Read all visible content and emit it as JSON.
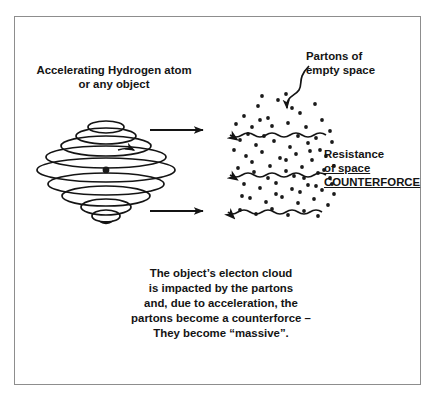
{
  "figure": {
    "type": "physics-concept-diagram",
    "background_color": "#ffffff",
    "border_color": "#8d8d8d",
    "ink_color": "#141414"
  },
  "labels": {
    "object_line1": "Accelerating Hydrogen atom",
    "object_line2": "or any object",
    "partons_line1": "Partons of",
    "partons_line2": "empty space",
    "resistance_line1": "Resistance",
    "resistance_line2": "of space",
    "resistance_line3": "COUNTERFORCE"
  },
  "caption": {
    "line1": "The object’s electon cloud",
    "line2": "is impacted by the partons",
    "line3": "and, due to acceleration, the",
    "line4": "partons become a counterforce –",
    "line5": "They become “massive”."
  },
  "diagram_data": {
    "object": {
      "name": "accelerating-hydrogen-atom",
      "shape": "stacked-concentric-ellipses",
      "center_x": 106,
      "center_y": 170,
      "ellipse_count": 9,
      "nucleus_dot": {
        "cx": 106,
        "cy": 170,
        "r": 3.4
      },
      "ellipses": [
        {
          "cy": 127,
          "rx": 18,
          "ry": 6
        },
        {
          "cy": 136,
          "rx": 30,
          "ry": 8
        },
        {
          "cy": 146,
          "rx": 45,
          "ry": 10
        },
        {
          "cy": 157,
          "rx": 60,
          "ry": 11
        },
        {
          "cy": 170,
          "rx": 69,
          "ry": 12
        },
        {
          "cy": 184,
          "rx": 58,
          "ry": 11
        },
        {
          "cy": 196,
          "rx": 44,
          "ry": 10
        },
        {
          "cy": 207,
          "rx": 25,
          "ry": 8
        },
        {
          "cy": 216,
          "rx": 14,
          "ry": 6
        }
      ]
    },
    "motion_arrows": [
      {
        "name": "motion-arrow-top",
        "direction": "right",
        "x1": 150,
        "y1": 130,
        "x2": 203,
        "y2": 130
      },
      {
        "name": "motion-arrow-bottom",
        "direction": "right",
        "x1": 150,
        "y1": 211,
        "x2": 203,
        "y2": 211
      }
    ],
    "counterforce_arrows": [
      {
        "name": "counterforce-wave-top",
        "direction": "left",
        "y": 135,
        "x_tip": 228,
        "x_tail": 326
      },
      {
        "name": "counterforce-wave-middle",
        "direction": "left",
        "y": 175,
        "x_tip": 228,
        "x_tail": 326
      },
      {
        "name": "counterforce-wave-bottom",
        "direction": "left",
        "y": 212,
        "x_tip": 228,
        "x_tail": 322
      }
    ],
    "pointer_arrow": {
      "name": "partons-pointer-arrow",
      "style": "curved-s-shape",
      "from_x": 309,
      "from_y": 66,
      "to_x": 287,
      "to_y": 113
    },
    "parton_dots": {
      "count": 74,
      "radius": 1.9,
      "region": {
        "x": 232,
        "y": 98,
        "width": 100,
        "height": 122
      },
      "points": [
        [
          258,
          106
        ],
        [
          278,
          100
        ],
        [
          292,
          108
        ],
        [
          244,
          116
        ],
        [
          268,
          118
        ],
        [
          300,
          113
        ],
        [
          315,
          104
        ],
        [
          236,
          124
        ],
        [
          252,
          127
        ],
        [
          272,
          126
        ],
        [
          288,
          123
        ],
        [
          306,
          127
        ],
        [
          322,
          120
        ],
        [
          330,
          131
        ],
        [
          240,
          140
        ],
        [
          256,
          145
        ],
        [
          274,
          141
        ],
        [
          290,
          147
        ],
        [
          308,
          143
        ],
        [
          320,
          150
        ],
        [
          332,
          142
        ],
        [
          246,
          156
        ],
        [
          262,
          152
        ],
        [
          280,
          158
        ],
        [
          296,
          154
        ],
        [
          312,
          160
        ],
        [
          326,
          156
        ],
        [
          334,
          166
        ],
        [
          238,
          168
        ],
        [
          254,
          172
        ],
        [
          270,
          166
        ],
        [
          286,
          171
        ],
        [
          302,
          167
        ],
        [
          318,
          173
        ],
        [
          330,
          178
        ],
        [
          244,
          184
        ],
        [
          260,
          188
        ],
        [
          276,
          183
        ],
        [
          292,
          189
        ],
        [
          308,
          185
        ],
        [
          322,
          190
        ],
        [
          334,
          194
        ],
        [
          250,
          198
        ],
        [
          266,
          202
        ],
        [
          282,
          197
        ],
        [
          298,
          203
        ],
        [
          314,
          199
        ],
        [
          328,
          205
        ],
        [
          240,
          210
        ],
        [
          256,
          214
        ],
        [
          272,
          209
        ],
        [
          288,
          215
        ],
        [
          304,
          211
        ],
        [
          318,
          216
        ],
        [
          262,
          96
        ],
        [
          286,
          94
        ],
        [
          248,
          134
        ],
        [
          264,
          136
        ],
        [
          298,
          136
        ],
        [
          316,
          138
        ],
        [
          234,
          150
        ],
        [
          268,
          178
        ],
        [
          294,
          176
        ],
        [
          310,
          151
        ],
        [
          324,
          170
        ],
        [
          332,
          184
        ],
        [
          252,
          162
        ],
        [
          286,
          160
        ],
        [
          300,
          192
        ],
        [
          316,
          186
        ],
        [
          242,
          196
        ],
        [
          276,
          194
        ],
        [
          260,
          120
        ],
        [
          304,
          178
        ]
      ]
    }
  }
}
